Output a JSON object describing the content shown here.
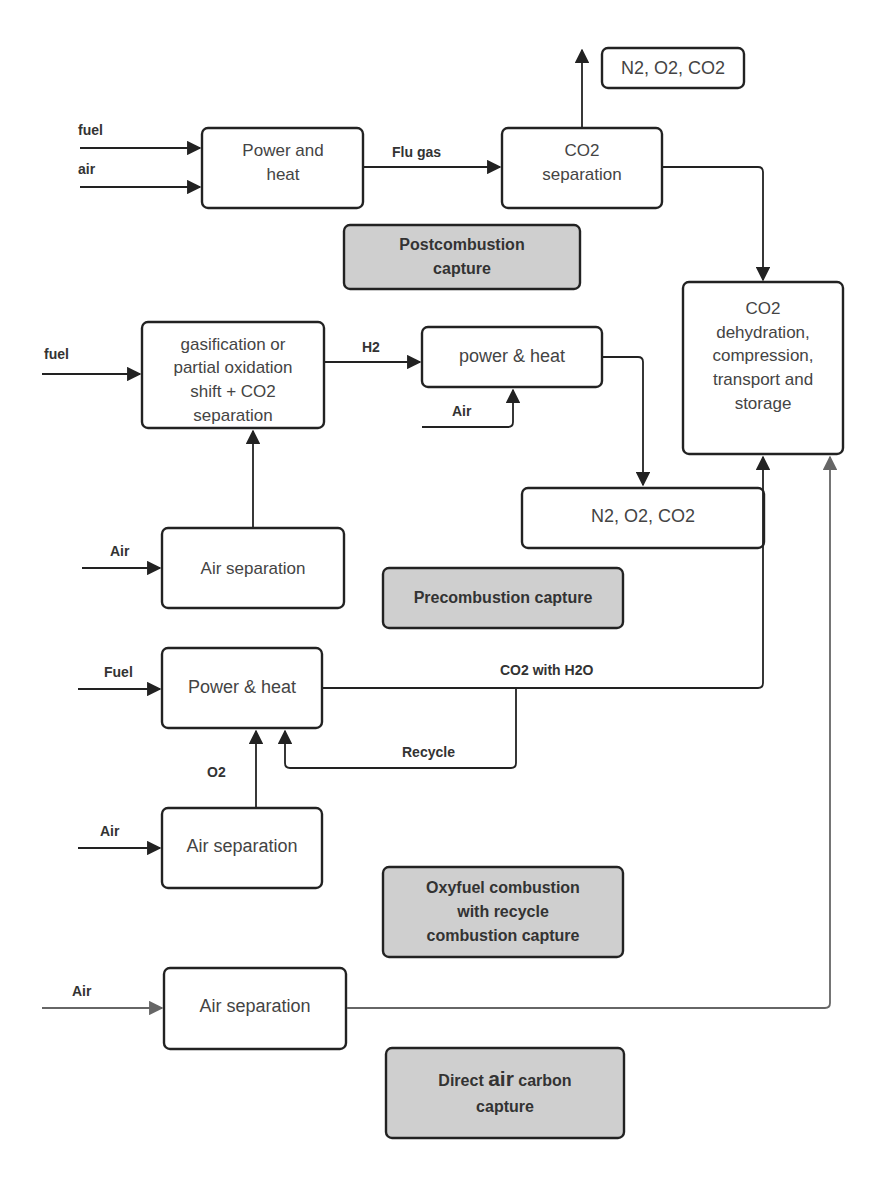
{
  "diagram": {
    "colors": {
      "line": "#222222",
      "label_fill": "#cfcfcf",
      "direct_air_line": "#666666"
    },
    "postcombustion": {
      "inputs": [
        "fuel",
        "air"
      ],
      "power_box": [
        "Power and",
        "heat"
      ],
      "flow_label": "Flu gas",
      "separation_box": [
        "CO2",
        "separation"
      ],
      "vent_box": "N2, O2, CO2",
      "category": [
        "Postcombustion",
        "capture"
      ]
    },
    "storage_box": [
      "CO2",
      "dehydration,",
      "compression,",
      "transport and",
      "storage"
    ],
    "precombustion": {
      "input": "fuel",
      "gasification_box": [
        "gasification or",
        "partial oxidation",
        "shift + CO2",
        "separation"
      ],
      "flow_label": "H2",
      "power_box": "power & heat",
      "air_input": "Air",
      "vent_box": "N2, O2, CO2",
      "air_sep_input": "Air",
      "air_sep_box": "Air separation",
      "category": "Precombustion capture"
    },
    "oxyfuel": {
      "input": "Fuel",
      "power_box": "Power & heat",
      "flow_label": "CO2 with H2O",
      "recycle_label": "Recycle",
      "o2_label": "O2",
      "air_sep_input": "Air",
      "air_sep_box": "Air separation",
      "category": [
        "Oxyfuel combustion",
        "with recycle",
        "combustion capture"
      ]
    },
    "direct_air": {
      "input": "Air",
      "air_sep_box": "Air separation",
      "category_prefix": "Direct ",
      "category_emph": "air",
      "category_suffix": " carbon",
      "category_line2": "capture"
    }
  }
}
